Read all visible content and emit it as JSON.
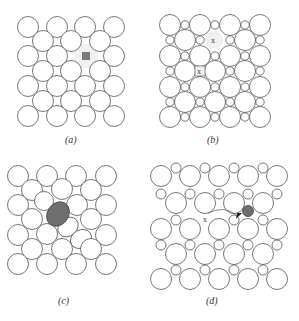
{
  "figure": {
    "panels": [
      {
        "id": "a",
        "label": "(a)",
        "description": "Square lattice of large atoms with a vacancy (gray square)",
        "marker": "vacancy-square"
      },
      {
        "id": "b",
        "label": "(b)",
        "description": "Lattice with small interstitial atoms; two interstitial sites marked x",
        "markers": [
          "x",
          "x"
        ]
      },
      {
        "id": "c",
        "label": "(c)",
        "description": "Substitutional/self-interstitial distortion with a dark elongated atom"
      },
      {
        "id": "d",
        "label": "(d)",
        "description": "Interstitial diffusion: dark atom jumping toward site x, arrow indicates path",
        "markers": [
          "x"
        ]
      }
    ],
    "colors": {
      "outline": "#555555",
      "vacancy_fill": "#7a7a7a",
      "dark_atom_fill": "#6e6e6e",
      "highlight_bg": "#f0f0f0"
    }
  }
}
